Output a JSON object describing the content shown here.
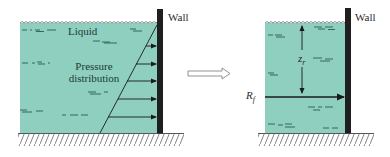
{
  "diagram": {
    "left_panel": {
      "wall_label": "Wall",
      "liquid_label": "Liquid",
      "pressure_label_line1": "Pressure",
      "pressure_label_line2": "distribution",
      "arrow_count": 5
    },
    "transition_arrow": "hollow-right-arrow",
    "right_panel": {
      "wall_label": "Wall",
      "depth_label_base": "z",
      "depth_label_sub": "r",
      "force_label_base": "R",
      "force_label_sub": "f"
    },
    "colors": {
      "liquid": "#8ecfbf",
      "wall": "#1f1f1f",
      "lines": "#1a1a1a",
      "hatch": "#555555"
    }
  }
}
